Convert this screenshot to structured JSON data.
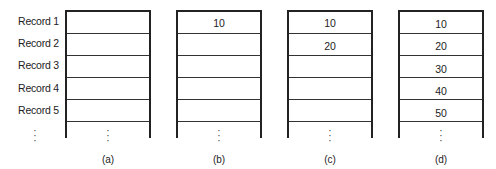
{
  "row_labels": [
    "Record 1",
    "Record 2",
    "Record 3",
    "Record 4",
    "Record 5"
  ],
  "tables": [
    {
      "caption": "(a)",
      "values": [
        "",
        "",
        "",
        "",
        ""
      ]
    },
    {
      "caption": "(b)",
      "values": [
        "10",
        "",
        "",
        "",
        ""
      ]
    },
    {
      "caption": "(c)",
      "values": [
        "10",
        "20",
        "",
        "",
        ""
      ]
    },
    {
      "caption": "(d)",
      "values": [
        "10",
        "20",
        "30",
        "40",
        "50"
      ]
    }
  ],
  "ellipsis": "⋮"
}
